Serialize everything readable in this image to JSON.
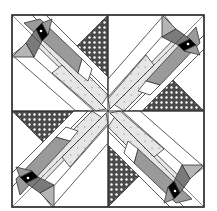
{
  "block": {
    "name": "Bird quilt block",
    "description": "Four-fold rotational quilt block with diagonal bird strips and dotted triangles",
    "outer_square": {
      "x": 12,
      "y": 15,
      "size": 192
    },
    "center": {
      "x": 108,
      "y": 110
    }
  },
  "colors": {
    "background": "#ffffff",
    "outline": "#333333",
    "bird_body": "#9a9a9a",
    "bird_head": "#7a7a7a",
    "eye": "#000000",
    "tail_fabric": "#e2e2e2",
    "tail_dots": "#b0b0b0",
    "triangle_fabric": "#4a4a4a",
    "triangle_dots": "#ffffff"
  },
  "quadrants": [
    {
      "name": "top-left",
      "rotation": 0
    },
    {
      "name": "top-right",
      "rotation": 90
    },
    {
      "name": "bottom-right",
      "rotation": 180
    },
    {
      "name": "bottom-left",
      "rotation": 270
    }
  ]
}
